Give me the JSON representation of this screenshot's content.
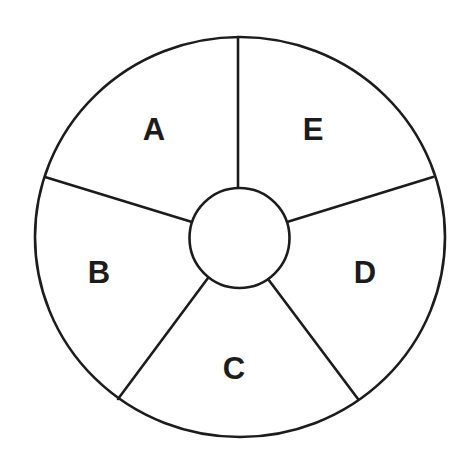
{
  "diagram": {
    "type": "segmented-wheel",
    "segment_count": 5,
    "center_circle_label": "",
    "colors": {
      "stroke": "#1c1c1c",
      "background": "#ffffff"
    },
    "segments": [
      {
        "label": "A",
        "position": "upper-left"
      },
      {
        "label": "B",
        "position": "left"
      },
      {
        "label": "C",
        "position": "bottom"
      },
      {
        "label": "D",
        "position": "right"
      },
      {
        "label": "E",
        "position": "upper-right"
      }
    ]
  }
}
